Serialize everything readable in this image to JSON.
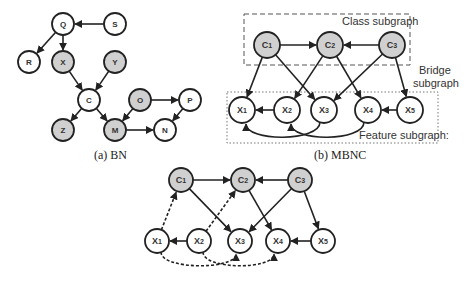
{
  "colors": {
    "node_fill_plain": "#ffffff",
    "node_fill_shaded": "#d0d0d0",
    "stroke": "#222222"
  },
  "bn": {
    "caption": "(a) BN",
    "nodes": [
      {
        "id": "Q",
        "label": "Q",
        "x": 63,
        "y": 24,
        "shaded": false
      },
      {
        "id": "S",
        "label": "S",
        "x": 115,
        "y": 24,
        "shaded": false
      },
      {
        "id": "R",
        "label": "R",
        "x": 29,
        "y": 62,
        "shaded": false
      },
      {
        "id": "X",
        "label": "X",
        "x": 63,
        "y": 62,
        "shaded": true
      },
      {
        "id": "Y",
        "label": "Y",
        "x": 115,
        "y": 62,
        "shaded": true
      },
      {
        "id": "C",
        "label": "C",
        "x": 89,
        "y": 100,
        "shaded": false
      },
      {
        "id": "O",
        "label": "O",
        "x": 140,
        "y": 100,
        "shaded": true
      },
      {
        "id": "P",
        "label": "P",
        "x": 190,
        "y": 100,
        "shaded": false
      },
      {
        "id": "Z",
        "label": "Z",
        "x": 63,
        "y": 130,
        "shaded": true
      },
      {
        "id": "M",
        "label": "M",
        "x": 115,
        "y": 130,
        "shaded": true
      },
      {
        "id": "N",
        "label": "N",
        "x": 165,
        "y": 130,
        "shaded": false
      }
    ],
    "edges": [
      [
        "S",
        "Q"
      ],
      [
        "Q",
        "R"
      ],
      [
        "Q",
        "X"
      ],
      [
        "X",
        "C"
      ],
      [
        "Y",
        "C"
      ],
      [
        "C",
        "Z"
      ],
      [
        "C",
        "M"
      ],
      [
        "O",
        "M"
      ],
      [
        "O",
        "P"
      ],
      [
        "P",
        "N"
      ],
      [
        "M",
        "N"
      ]
    ],
    "radius": 11
  },
  "mbnc": {
    "caption": "(b) MBNC",
    "class_subgraph_label": "Class subgraph",
    "bridge_subgraph_label_line1": "Bridge",
    "bridge_subgraph_label_line2": "subgraph",
    "feature_subgraph_label": "Feature subgraph:",
    "nodes": [
      {
        "id": "C1",
        "label": "C1",
        "x": 267,
        "y": 45,
        "shaded": true
      },
      {
        "id": "C2",
        "label": "C2",
        "x": 330,
        "y": 45,
        "shaded": true
      },
      {
        "id": "C3",
        "label": "C3",
        "x": 392,
        "y": 45,
        "shaded": true
      },
      {
        "id": "X1",
        "label": "X1",
        "x": 242,
        "y": 110,
        "shaded": false
      },
      {
        "id": "X2",
        "label": "X2",
        "x": 287,
        "y": 110,
        "shaded": false
      },
      {
        "id": "X3",
        "label": "X3",
        "x": 324,
        "y": 110,
        "shaded": false
      },
      {
        "id": "X4",
        "label": "X4",
        "x": 368,
        "y": 110,
        "shaded": false
      },
      {
        "id": "X5",
        "label": "X5",
        "x": 410,
        "y": 110,
        "shaded": false
      }
    ],
    "edges": [
      [
        "C1",
        "C2"
      ],
      [
        "C3",
        "C2"
      ],
      [
        "C1",
        "X1"
      ],
      [
        "C1",
        "X3"
      ],
      [
        "C2",
        "X2"
      ],
      [
        "C2",
        "X4"
      ],
      [
        "C3",
        "X3"
      ],
      [
        "C3",
        "X5"
      ],
      [
        "X2",
        "X1"
      ],
      [
        "X5",
        "X4"
      ]
    ],
    "curved_edges": [
      {
        "from": "X3",
        "to": "X1",
        "dip": 18
      },
      {
        "from": "X4",
        "to": "X2",
        "dip": 18
      }
    ],
    "radius": 13
  },
  "bottom": {
    "nodes": [
      {
        "id": "C1",
        "label": "C1",
        "x": 181,
        "y": 180,
        "shaded": true
      },
      {
        "id": "C2",
        "label": "C2",
        "x": 243,
        "y": 180,
        "shaded": true
      },
      {
        "id": "C3",
        "label": "C3",
        "x": 300,
        "y": 180,
        "shaded": true
      },
      {
        "id": "X1",
        "label": "X1",
        "x": 157,
        "y": 241,
        "shaded": false
      },
      {
        "id": "X2",
        "label": "X2",
        "x": 199,
        "y": 241,
        "shaded": false
      },
      {
        "id": "X3",
        "label": "X3",
        "x": 240,
        "y": 241,
        "shaded": false
      },
      {
        "id": "X4",
        "label": "X4",
        "x": 278,
        "y": 241,
        "shaded": false
      },
      {
        "id": "X5",
        "label": "X5",
        "x": 323,
        "y": 241,
        "shaded": false
      }
    ],
    "edges": [
      [
        "C1",
        "C2"
      ],
      [
        "C3",
        "C2"
      ],
      [
        "C1",
        "X3"
      ],
      [
        "C2",
        "X4"
      ],
      [
        "C3",
        "X3"
      ],
      [
        "C3",
        "X5"
      ],
      [
        "X2",
        "X1"
      ],
      [
        "X5",
        "X4"
      ]
    ],
    "dashed_edges": [
      [
        "X1",
        "C1"
      ],
      [
        "X2",
        "C2"
      ]
    ],
    "dashed_curved_edges": [
      {
        "from": "X1",
        "to": "X3",
        "dip": 16
      },
      {
        "from": "X2",
        "to": "X4",
        "dip": 16
      }
    ],
    "radius": 12
  }
}
